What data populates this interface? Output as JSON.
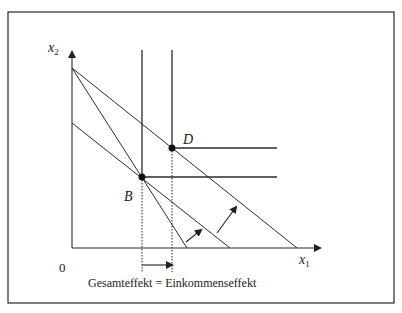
{
  "diagram": {
    "axes": {
      "y_label": "x",
      "y_label_sub": "2",
      "x_label": "x",
      "x_label_sub": "1",
      "origin_label": "0"
    },
    "points": {
      "B": "B",
      "D": "D"
    },
    "caption": "Gesamteffekt = Einkommenseffekt",
    "colors": {
      "line": "#2b2b2b",
      "frame": "#3a3a3a",
      "background": "#ffffff"
    }
  }
}
